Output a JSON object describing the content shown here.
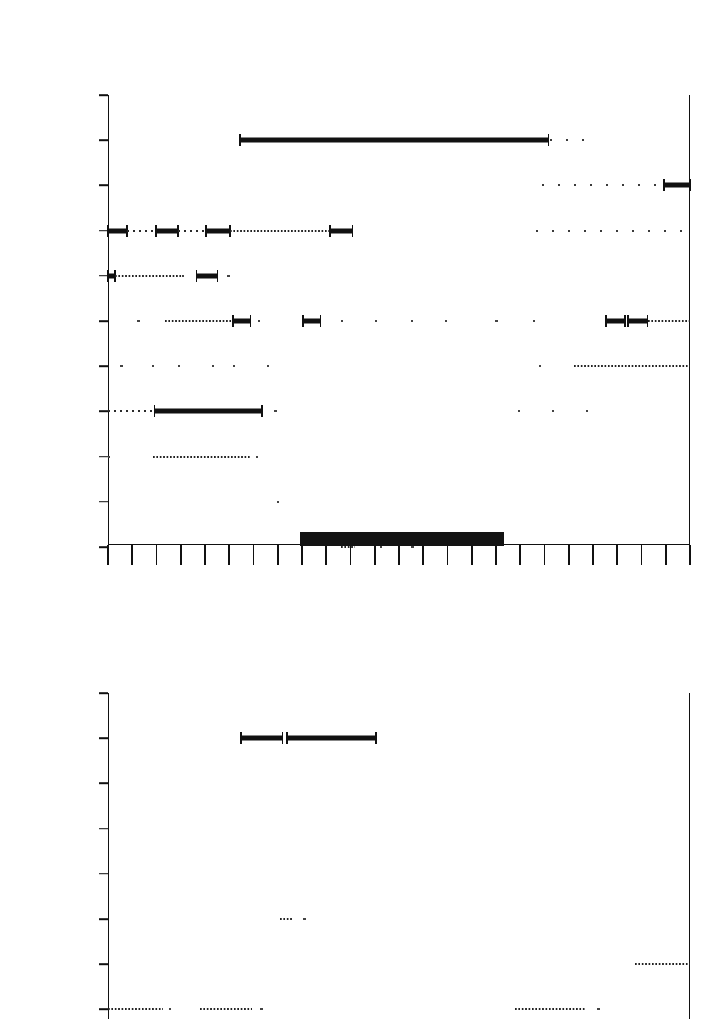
{
  "figure": {
    "type": "actogram",
    "panel_count": 2
  },
  "chart_data": [
    {
      "type": "table",
      "panel": 1,
      "title": "",
      "xlabel": "",
      "ylabel": "",
      "group_labels": [
        {
          "text": "May",
          "before_row": "24-25"
        },
        {
          "text": "June",
          "before_row": "1-2"
        }
      ],
      "categories": [
        "24-25",
        "25-26",
        "26-27",
        "27-28",
        "28-29",
        "29-30",
        "30-31",
        "31-1",
        "1-2",
        "2-3",
        "3-4"
      ],
      "x_axis": {
        "tick_count": 25,
        "labels": [
          "P.M.",
          "A.M."
        ],
        "label_positions": [
          0.25,
          0.75
        ],
        "night_band_start": 0.33,
        "night_band_end": 0.68
      },
      "annotations": [
        {
          "text": "Born",
          "row": "24-25",
          "x_frac": 0.51
        },
        {
          "text": "Wind",
          "row": "31-1",
          "x_frac": 0.09
        },
        {
          "text": "Left nest",
          "row": "3-4",
          "x_frac": 0.72
        }
      ],
      "rows": [
        {
          "category": "24-25",
          "marks": []
        },
        {
          "category": "25-26",
          "marks": [
            {
              "kind": "bar",
              "x0": 0.227,
              "x1": 0.757
            },
            {
              "kind": "dots",
              "density": "sparse",
              "x0": 0.76,
              "x1": 0.84
            }
          ]
        },
        {
          "category": "26-27",
          "marks": [
            {
              "kind": "dots",
              "density": "sparse",
              "x0": 0.745,
              "x1": 0.985
            },
            {
              "kind": "bar",
              "x0": 0.955,
              "x1": 1.0
            }
          ]
        },
        {
          "category": "27-28",
          "marks": [
            {
              "kind": "bar",
              "x0": 0.0,
              "x1": 0.032
            },
            {
              "kind": "dots",
              "density": "normal",
              "x0": 0.032,
              "x1": 0.082
            },
            {
              "kind": "bar",
              "x0": 0.082,
              "x1": 0.12
            },
            {
              "kind": "dots",
              "density": "normal",
              "x0": 0.12,
              "x1": 0.168
            },
            {
              "kind": "bar",
              "x0": 0.168,
              "x1": 0.209
            },
            {
              "kind": "dots",
              "density": "dense",
              "x0": 0.209,
              "x1": 0.381
            },
            {
              "kind": "bar",
              "x0": 0.381,
              "x1": 0.42
            },
            {
              "kind": "dots",
              "density": "sparse",
              "x0": 0.735,
              "x1": 1.0
            }
          ]
        },
        {
          "category": "28-29",
          "marks": [
            {
              "kind": "bar",
              "x0": 0.0,
              "x1": 0.012
            },
            {
              "kind": "dots",
              "density": "dense",
              "x0": 0.012,
              "x1": 0.128
            },
            {
              "kind": "dots",
              "density": "vsparse",
              "x0": 0.128,
              "x1": 0.152
            },
            {
              "kind": "bar",
              "x0": 0.152,
              "x1": 0.188
            },
            {
              "kind": "dots",
              "density": "vsparse",
              "x0": 0.205,
              "x1": 0.26
            }
          ]
        },
        {
          "category": "29-30",
          "marks": [
            {
              "kind": "dots",
              "density": "vsparse",
              "x0": 0.05,
              "x1": 0.085
            },
            {
              "kind": "dots",
              "density": "dense",
              "x0": 0.098,
              "x1": 0.215
            },
            {
              "kind": "bar",
              "x0": 0.215,
              "x1": 0.245
            },
            {
              "kind": "dots",
              "density": "vsparse",
              "x0": 0.258,
              "x1": 0.278
            },
            {
              "kind": "bar",
              "x0": 0.335,
              "x1": 0.365
            },
            {
              "kind": "dots",
              "density": "vsparse",
              "x0": 0.4,
              "x1": 0.47
            },
            {
              "kind": "dots",
              "density": "vsparse",
              "x0": 0.52,
              "x1": 0.62
            },
            {
              "kind": "dots",
              "density": "vsparse",
              "x0": 0.665,
              "x1": 0.69
            },
            {
              "kind": "dots",
              "density": "vsparse",
              "x0": 0.73,
              "x1": 0.76
            },
            {
              "kind": "bar",
              "x0": 0.855,
              "x1": 0.888
            },
            {
              "kind": "bar",
              "x0": 0.893,
              "x1": 0.927
            },
            {
              "kind": "dots",
              "density": "dense",
              "x0": 0.927,
              "x1": 1.0
            }
          ]
        },
        {
          "category": "30-31",
          "marks": [
            {
              "kind": "dots",
              "density": "vsparse",
              "x0": 0.02,
              "x1": 0.045
            },
            {
              "kind": "dots",
              "density": "vsparse",
              "x0": 0.075,
              "x1": 0.1
            },
            {
              "kind": "dots",
              "density": "vsparse",
              "x0": 0.12,
              "x1": 0.185
            },
            {
              "kind": "dots",
              "density": "vsparse",
              "x0": 0.215,
              "x1": 0.32
            },
            {
              "kind": "dots",
              "density": "vsparse",
              "x0": 0.74,
              "x1": 0.765
            },
            {
              "kind": "dots",
              "density": "dense",
              "x0": 0.8,
              "x1": 1.0
            }
          ]
        },
        {
          "category": "31-1",
          "marks": [
            {
              "kind": "dots",
              "density": "normal",
              "x0": 0.0,
              "x1": 0.075
            },
            {
              "kind": "bar",
              "x0": 0.08,
              "x1": 0.265
            },
            {
              "kind": "dots",
              "density": "vsparse",
              "x0": 0.285,
              "x1": 0.33
            },
            {
              "kind": "dots",
              "density": "vsparse",
              "x0": 0.705,
              "x1": 0.825
            }
          ]
        },
        {
          "category": "1-2",
          "marks": [
            {
              "kind": "dots",
              "density": "vsparse",
              "x0": 0.0,
              "x1": 0.03
            },
            {
              "kind": "dots",
              "density": "dense",
              "x0": 0.078,
              "x1": 0.245
            },
            {
              "kind": "dots",
              "density": "vsparse",
              "x0": 0.255,
              "x1": 0.275
            }
          ]
        },
        {
          "category": "2-3",
          "marks": [
            {
              "kind": "dots",
              "density": "vsparse",
              "x0": 0.29,
              "x1": 0.312
            }
          ]
        },
        {
          "category": "3-4",
          "marks": [
            {
              "kind": "dots",
              "density": "dense",
              "x0": 0.4,
              "x1": 0.425
            },
            {
              "kind": "dots",
              "density": "vsparse",
              "x0": 0.468,
              "x1": 0.482
            },
            {
              "kind": "dots",
              "density": "vsparse",
              "x0": 0.52,
              "x1": 0.548
            }
          ]
        }
      ]
    },
    {
      "type": "table",
      "panel": 2,
      "title": "",
      "xlabel": "",
      "ylabel": "",
      "group_labels": [
        {
          "text": "May",
          "before_row": "24-25"
        },
        {
          "text": "June",
          "before_row": "1-2"
        }
      ],
      "categories": [
        "24-25",
        "25-26",
        "26-27",
        "27-28",
        "28-29",
        "29-30",
        "30-31",
        "31-1"
      ],
      "annotations": [
        {
          "text": "Born",
          "row": "24-25",
          "x_frac": 0.51
        },
        {
          "text": "Wind",
          "row": "31-1",
          "x_frac": 0.09
        }
      ],
      "rows": [
        {
          "category": "24-25",
          "marks": []
        },
        {
          "category": "25-26",
          "marks": [
            {
              "kind": "bar",
              "x0": 0.228,
              "x1": 0.3
            },
            {
              "kind": "bar",
              "x0": 0.308,
              "x1": 0.46
            }
          ]
        },
        {
          "category": "26-27",
          "marks": []
        },
        {
          "category": "27-28",
          "marks": []
        },
        {
          "category": "28-29",
          "marks": []
        },
        {
          "category": "29-30",
          "marks": [
            {
              "kind": "dots",
              "density": "dense",
              "x0": 0.295,
              "x1": 0.318
            },
            {
              "kind": "dots",
              "density": "vsparse",
              "x0": 0.335,
              "x1": 0.35
            }
          ]
        },
        {
          "category": "30-31",
          "marks": [
            {
              "kind": "dots",
              "density": "dense",
              "x0": 0.905,
              "x1": 1.0
            }
          ]
        },
        {
          "category": "31-1",
          "marks": [
            {
              "kind": "dots",
              "density": "dense",
              "x0": 0.0,
              "x1": 0.095
            },
            {
              "kind": "dots",
              "density": "vsparse",
              "x0": 0.105,
              "x1": 0.135
            },
            {
              "kind": "dots",
              "density": "dense",
              "x0": 0.158,
              "x1": 0.248
            },
            {
              "kind": "dots",
              "density": "vsparse",
              "x0": 0.262,
              "x1": 0.278
            },
            {
              "kind": "dots",
              "density": "dense",
              "x0": 0.7,
              "x1": 0.82
            },
            {
              "kind": "dots",
              "density": "vsparse",
              "x0": 0.84,
              "x1": 0.87
            }
          ]
        }
      ]
    }
  ]
}
